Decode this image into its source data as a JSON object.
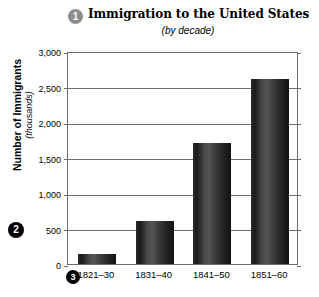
{
  "chart_data": {
    "type": "bar",
    "title": "Immigration to the United States",
    "subtitle": "(by decade)",
    "xlabel": "",
    "ylabel": "Number of Immigrants",
    "ylabel_sub": "(thousands)",
    "categories": [
      "1821–30",
      "1831–40",
      "1841–50",
      "1851–60"
    ],
    "values": [
      140,
      600,
      1700,
      2600
    ],
    "ylim": [
      0,
      3000
    ],
    "ytick_values": [
      0,
      500,
      1000,
      1500,
      2000,
      2500,
      3000
    ],
    "ytick_labels": [
      "0",
      "500",
      "1,000",
      "1,500",
      "2,000",
      "2,500",
      "3,000"
    ],
    "grid": true,
    "legend": "none",
    "series": [
      {
        "name": "Immigrants",
        "values": [
          140,
          600,
          1700,
          2600
        ]
      }
    ]
  },
  "annotations": {
    "markers": [
      {
        "id": "1",
        "label": "1",
        "target": "chart-title",
        "color": "#8d8d8d"
      },
      {
        "id": "2",
        "label": "2",
        "target": "y-axis-title",
        "color": "#000000"
      },
      {
        "id": "3",
        "label": "3",
        "target": "x-axis-labels",
        "color": "#000000"
      }
    ]
  },
  "colors": {
    "bar_dark": "#1a1a1a",
    "bar_light": "#555555",
    "axis": "#6d6d6d",
    "marker_gray": "#8d8d8d",
    "marker_black": "#000000",
    "background": "#ffffff"
  }
}
